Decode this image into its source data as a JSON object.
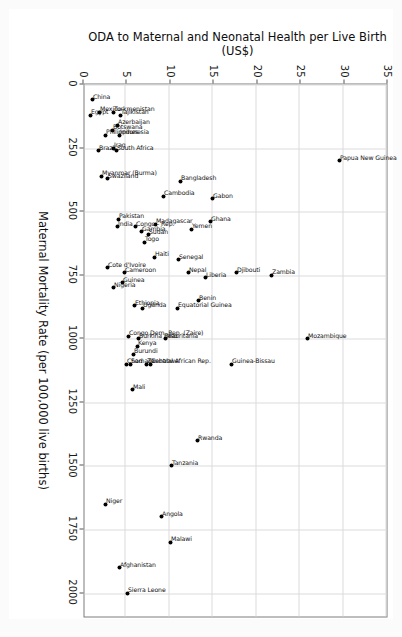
{
  "figure": {
    "orientation": "rotated-90-clockwise",
    "background": "#ffffff",
    "frame_color": "#7d7d7d",
    "grid_color": "#dcdcdc",
    "point_color": "#000000"
  },
  "chart_data": {
    "type": "scatter",
    "title": "",
    "xlabel": "Maternal Mortality Rate (per 100,000 live births)",
    "ylabel": "ODA to Maternal and Neonatal Health per Live Birth (US$)",
    "xlim": [
      0,
      2100
    ],
    "ylim": [
      0,
      35
    ],
    "xticks": [
      0,
      250,
      500,
      750,
      1000,
      1250,
      1500,
      1750,
      2000
    ],
    "xticklabels": [
      "0",
      "250",
      "500",
      "750",
      "1000",
      "1250",
      "1500",
      "1750",
      "2000"
    ],
    "yticks": [
      0,
      5,
      10,
      15,
      20,
      25,
      30,
      35
    ],
    "yticklabels": [
      "0",
      "5",
      "10",
      "15",
      "20",
      "25",
      "30",
      "35"
    ],
    "grid": true,
    "legend": null,
    "points": [
      {
        "label": "Papua New Guinea",
        "x": 300,
        "y": 29.6
      },
      {
        "label": "Mozambique",
        "x": 1000,
        "y": 25.9
      },
      {
        "label": "Zambia",
        "x": 750,
        "y": 21.8
      },
      {
        "label": "Djibouti",
        "x": 740,
        "y": 17.7
      },
      {
        "label": "Guinea-Bissau",
        "x": 1100,
        "y": 17.1
      },
      {
        "label": "Gabon",
        "x": 450,
        "y": 15.0
      },
      {
        "label": "Ghana",
        "x": 540,
        "y": 14.7
      },
      {
        "label": "Liberia",
        "x": 760,
        "y": 14.2
      },
      {
        "label": "Benin",
        "x": 850,
        "y": 13.4
      },
      {
        "label": "Rwanda",
        "x": 1400,
        "y": 13.2
      },
      {
        "label": "Yemen",
        "x": 570,
        "y": 12.6
      },
      {
        "label": "Nepal",
        "x": 740,
        "y": 12.2
      },
      {
        "label": "Bangladesh",
        "x": 380,
        "y": 11.3
      },
      {
        "label": "Senegal",
        "x": 690,
        "y": 11.1
      },
      {
        "label": "Equatorial Guinea",
        "x": 880,
        "y": 10.9
      },
      {
        "label": "Tanzania",
        "x": 1500,
        "y": 10.2
      },
      {
        "label": "Malawi",
        "x": 1800,
        "y": 10.1
      },
      {
        "label": "Mauritania",
        "x": 1000,
        "y": 9.6
      },
      {
        "label": "Cambodia",
        "x": 440,
        "y": 9.3
      },
      {
        "label": "Angola",
        "x": 1700,
        "y": 9.1
      },
      {
        "label": "Madagascar",
        "x": 550,
        "y": 8.4
      },
      {
        "label": "Haiti",
        "x": 680,
        "y": 8.3
      },
      {
        "label": "Central African Rep.",
        "x": 1100,
        "y": 7.8
      },
      {
        "label": "Sudan",
        "x": 590,
        "y": 7.6
      },
      {
        "label": "Zimbabwe",
        "x": 1100,
        "y": 7.4
      },
      {
        "label": "Togo",
        "x": 620,
        "y": 7.1
      },
      {
        "label": "Uganda",
        "x": 880,
        "y": 6.9
      },
      {
        "label": "Gambia",
        "x": 580,
        "y": 6.8
      },
      {
        "label": "Burkina Faso",
        "x": 1000,
        "y": 6.5
      },
      {
        "label": "Kenya",
        "x": 1030,
        "y": 6.3
      },
      {
        "label": "Congo - Rep.",
        "x": 560,
        "y": 6.1
      },
      {
        "label": "Ethiopia",
        "x": 870,
        "y": 6.0
      },
      {
        "label": "Burundi",
        "x": 1060,
        "y": 5.9
      },
      {
        "label": "Mali",
        "x": 1200,
        "y": 5.7
      },
      {
        "label": "Somalia",
        "x": 1100,
        "y": 5.5
      },
      {
        "label": "Congo Dem. Rep. (Zaire)",
        "x": 990,
        "y": 5.3
      },
      {
        "label": "Chad",
        "x": 1100,
        "y": 5.1
      },
      {
        "label": "Sierra Leone",
        "x": 2000,
        "y": 5.2
      },
      {
        "label": "Cameroon",
        "x": 740,
        "y": 4.8
      },
      {
        "label": "Guinea",
        "x": 780,
        "y": 4.6
      },
      {
        "label": "Pakistan",
        "x": 530,
        "y": 4.2
      },
      {
        "label": "India",
        "x": 560,
        "y": 4.0
      },
      {
        "label": "Afghanistan",
        "x": 1900,
        "y": 4.3
      },
      {
        "label": "Nigeria",
        "x": 800,
        "y": 3.6
      },
      {
        "label": "Tajikistan",
        "x": 120,
        "y": 4.4
      },
      {
        "label": "Indonesia",
        "x": 200,
        "y": 4.3
      },
      {
        "label": "Azerbaijan",
        "x": 160,
        "y": 4.0
      },
      {
        "label": "South Africa",
        "x": 260,
        "y": 3.9
      },
      {
        "label": "Niger",
        "x": 1650,
        "y": 2.6
      },
      {
        "label": "Turkmenistan",
        "x": 110,
        "y": 3.6
      },
      {
        "label": "Botswana",
        "x": 180,
        "y": 3.5
      },
      {
        "label": "Iraq",
        "x": 250,
        "y": 3.6
      },
      {
        "label": "Cote d'Ivoire",
        "x": 720,
        "y": 2.9
      },
      {
        "label": "Swaziland",
        "x": 370,
        "y": 2.9
      },
      {
        "label": "Philippines",
        "x": 200,
        "y": 2.7
      },
      {
        "label": "Myanmar (Burma)",
        "x": 360,
        "y": 2.2
      },
      {
        "label": "Mexico",
        "x": 110,
        "y": 2.0
      },
      {
        "label": "Brazil",
        "x": 260,
        "y": 1.8
      },
      {
        "label": "China",
        "x": 60,
        "y": 1.1
      },
      {
        "label": "Egypt",
        "x": 120,
        "y": 0.9
      }
    ]
  }
}
